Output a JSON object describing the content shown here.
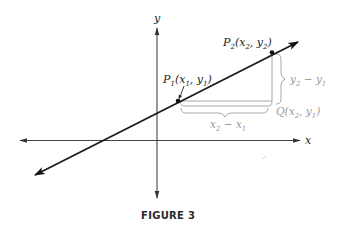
{
  "figure": {
    "caption": "FIGURE 3",
    "axes": {
      "x_label": "x",
      "y_label": "y"
    },
    "points": {
      "p1": {
        "name": "P",
        "sub": "1",
        "coords_open": "(x",
        "coords_sub1": "1",
        "coords_mid": ", y",
        "coords_sub2": "1",
        "coords_close": ")"
      },
      "p2": {
        "name": "P",
        "sub": "2",
        "coords_open": "(x",
        "coords_sub1": "2",
        "coords_mid": ", y",
        "coords_sub2": "2",
        "coords_close": ")"
      },
      "q": {
        "name": "Q",
        "coords_open": "(x",
        "coords_sub1": "2",
        "coords_mid": ", y",
        "coords_sub2": "1",
        "coords_close": ")"
      }
    },
    "brackets": {
      "rise": {
        "a": "y",
        "a_sub": "2",
        "op": " − ",
        "b": "y",
        "b_sub": "1"
      },
      "run": {
        "a": "x",
        "a_sub": "2",
        "op": " − ",
        "b": "x",
        "b_sub": "1"
      }
    },
    "colors": {
      "line": "#1a1a1a",
      "axis": "#333333",
      "guide": "#9a9a9a"
    }
  }
}
